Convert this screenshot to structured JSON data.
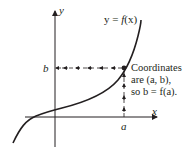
{
  "diagram": {
    "axes": {
      "x_label": "x",
      "y_label": "y"
    },
    "curve_label": {
      "prefix": "y = ",
      "func": "f",
      "arg": "(x)"
    },
    "point": {
      "x_label": "a",
      "y_label": "b"
    },
    "annotation": {
      "line1": "Coordinates",
      "line2": "are (a, b),",
      "line3": "so b = f(a)."
    },
    "colors": {
      "ink": "#231f20",
      "background": "#ffffff"
    }
  }
}
